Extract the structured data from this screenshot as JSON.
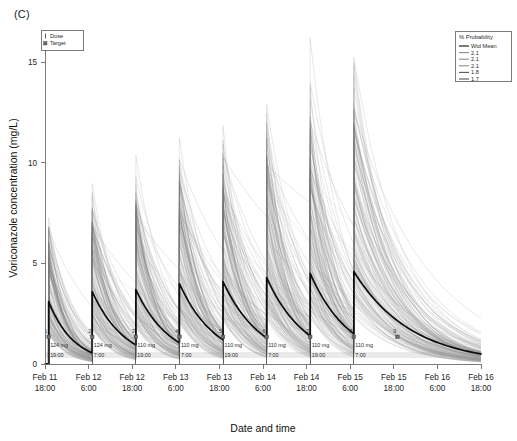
{
  "panel": {
    "letter": "(C)"
  },
  "chart_data": {
    "type": "line",
    "title": "",
    "xlabel": "Date and time",
    "ylabel": "Voriconazole concentration (mg/L)",
    "ylim": [
      0,
      16.5
    ],
    "yticks": [
      0,
      5,
      10,
      15
    ],
    "ytick_labels": [
      "0",
      "5",
      "10",
      "15"
    ],
    "xlim": [
      "Feb 11 18:00",
      "Feb 16 18:00"
    ],
    "xtick_labels": [
      {
        "date": "Feb 11",
        "time": "18:00"
      },
      {
        "date": "Feb 12",
        "time": "6:00"
      },
      {
        "date": "Feb 12",
        "time": "18:00"
      },
      {
        "date": "Feb 13",
        "time": "6:00"
      },
      {
        "date": "Feb 13",
        "time": "18:00"
      },
      {
        "date": "Feb 14",
        "time": "6:00"
      },
      {
        "date": "Feb 14",
        "time": "18:00"
      },
      {
        "date": "Feb 15",
        "time": "6:00"
      },
      {
        "date": "Feb 15",
        "time": "18:00"
      },
      {
        "date": "Feb 16",
        "time": "6:00"
      },
      {
        "date": "Feb 16",
        "time": "18:00"
      }
    ],
    "grid": false,
    "series": [
      {
        "name": "Wtd Mean",
        "style": "bold-black",
        "description": "Population weighted-mean predicted voriconazole concentration-time profile with sawtooth dosing peaks",
        "peaks": [
          3.1,
          3.6,
          3.7,
          4.0,
          4.1,
          4.3,
          4.5,
          4.6
        ],
        "troughs": [
          0.55,
          0.95,
          1.05,
          1.2,
          1.3,
          1.4,
          1.5,
          1.55
        ],
        "terminal_value": 0.5
      },
      {
        "name": "individual-simulated-profiles",
        "style": "faint-grey",
        "description": "Monte Carlo simulated individual concentration-time profiles",
        "count": 200
      }
    ],
    "doses": [
      {
        "index": "1",
        "amount": "124 mg",
        "time": "19:00",
        "day": "Feb 11"
      },
      {
        "index": "2",
        "amount": "124 mg",
        "time": "7:00",
        "day": "Feb 12"
      },
      {
        "index": "3",
        "amount": "110 mg",
        "time": "19:00",
        "day": "Feb 12"
      },
      {
        "index": "4",
        "amount": "110 mg",
        "time": "7:00",
        "day": "Feb 13"
      },
      {
        "index": "5",
        "amount": "110 mg",
        "time": "19:00",
        "day": "Feb 13"
      },
      {
        "index": "6",
        "amount": "110 mg",
        "time": "7:00",
        "day": "Feb 14"
      },
      {
        "index": "7",
        "amount": "110 mg",
        "time": "19:00",
        "day": "Feb 14"
      },
      {
        "index": "8",
        "amount": "110 mg",
        "time": "7:00",
        "day": "Feb 15"
      },
      {
        "index": "9",
        "amount": "",
        "time": "",
        "day": "Feb 15"
      }
    ]
  },
  "legend_markers": {
    "title": "",
    "items": [
      {
        "label": "Dose",
        "glyph": "dose-tick"
      },
      {
        "label": "Target",
        "glyph": "target-square"
      }
    ]
  },
  "legend_probability": {
    "title": "% Probability",
    "items": [
      {
        "label": "Wtd Mean",
        "color": "#111111",
        "width": 1.7
      },
      {
        "label": "2.1",
        "color": "#8c8c8c",
        "width": 0.8
      },
      {
        "label": "2.1",
        "color": "#8c8c8c",
        "width": 0.8
      },
      {
        "label": "2.1",
        "color": "#8c8c8c",
        "width": 0.8
      },
      {
        "label": "1.8",
        "color": "#555555",
        "width": 1.1
      },
      {
        "label": "1.7",
        "color": "#555555",
        "width": 1.1
      }
    ]
  },
  "colors": {
    "mean_line": "#0d0d0d",
    "spaghetti": "#9b9b9b",
    "axis": "#6d6d6d",
    "dose_marker": "#6e6e6e",
    "background": "#ffffff"
  }
}
